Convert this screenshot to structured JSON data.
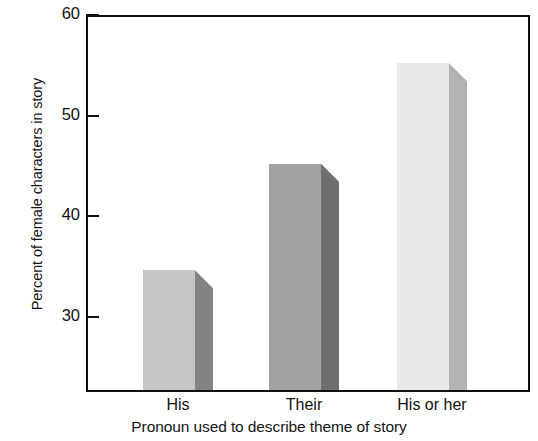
{
  "chart_data": {
    "type": "bar",
    "title": "",
    "xlabel": "Pronoun used to describe theme of story",
    "ylabel": "Percent of female characters in story",
    "categories": [
      "His",
      "Their",
      "His or her"
    ],
    "values": [
      34.6,
      45.2,
      55.2
    ],
    "ylim": [
      22.7,
      60
    ],
    "yticks": [
      "30",
      "40",
      "50",
      "60"
    ],
    "ytick_values": [
      30,
      40,
      50,
      60
    ],
    "grid": false,
    "legend": false,
    "bar_style": "3d-shaded",
    "bar_colors": [
      {
        "front": "#c6c6c6",
        "side": "#838383"
      },
      {
        "front": "#a3a3a3",
        "side": "#6f6f6f"
      },
      {
        "front": "#e9e9e9",
        "side": "#b2b2b2"
      }
    ],
    "axis_color": "#111111",
    "background": "#ffffff"
  },
  "figure": {
    "title_remnant": "·  ·"
  }
}
